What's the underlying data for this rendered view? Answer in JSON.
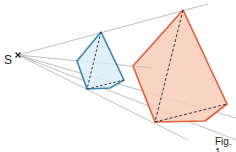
{
  "diagram": {
    "center_label": "S",
    "caption": "Fig. 1",
    "colors": {
      "rays": "#b8b8b8",
      "small_stroke": "#3a86b0",
      "small_fill": "#dceef8",
      "large_stroke": "#e0603a",
      "large_fill": "#f8cdb8",
      "hidden_edge": "#333333"
    },
    "center": [
      18,
      55
    ],
    "small_pyramid": {
      "apex": [
        101,
        32
      ],
      "base": [
        [
          77,
          61
        ],
        [
          87,
          89
        ],
        [
          110,
          88
        ],
        [
          124,
          80
        ]
      ]
    },
    "large_pyramid": {
      "apex": [
        183,
        10
      ],
      "base": [
        [
          133,
          66
        ],
        [
          155,
          122
        ],
        [
          205,
          121
        ],
        [
          227,
          104
        ]
      ]
    }
  }
}
